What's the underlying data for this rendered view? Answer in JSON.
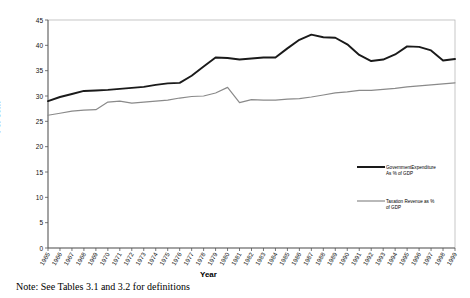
{
  "note": "Note: See Tables 3.1 and 3.2 for definitions",
  "axis": {
    "ylabel": "Per cent",
    "xlabel": "Year"
  },
  "legend": {
    "gov_label": "GovernmentExpenditure\nAs % of GDP",
    "tax_label": "Taxation Revenue as %\nof GDP",
    "gov_color": "#1a1a1a",
    "tax_color": "#8a8a8a"
  },
  "chart_data": {
    "type": "line",
    "title": "",
    "xlabel": "Year",
    "ylabel": "Per cent",
    "ylim": [
      0,
      45
    ],
    "yticks": [
      0,
      5,
      10,
      15,
      20,
      25,
      30,
      35,
      40,
      45
    ],
    "grid": false,
    "legend_position": "right",
    "categories": [
      "1965",
      "1966",
      "1967",
      "1968",
      "1969",
      "1970",
      "1971",
      "1972",
      "1973",
      "1974",
      "1975",
      "1976",
      "1977",
      "1978",
      "1979",
      "1980",
      "1981",
      "1982",
      "1983",
      "1984",
      "1985",
      "1986",
      "1987",
      "1988",
      "1989",
      "1990",
      "1991",
      "1992",
      "1993",
      "1994",
      "1995",
      "1996",
      "1997",
      "1998",
      "1999"
    ],
    "series": [
      {
        "name": "GovernmentExpenditure As % of GDP",
        "color": "#1a1a1a",
        "values": [
          29.0,
          29.8,
          30.4,
          31.0,
          31.1,
          31.2,
          31.4,
          31.6,
          31.8,
          32.2,
          32.5,
          32.6,
          34.0,
          35.8,
          37.6,
          37.5,
          37.2,
          37.4,
          37.6,
          37.6,
          39.4,
          41.1,
          42.1,
          41.6,
          41.5,
          40.2,
          38.1,
          36.9,
          37.2,
          38.2,
          39.8,
          39.7,
          39.0,
          37.0,
          37.3
        ]
      },
      {
        "name": "Taxation Revenue as % of GDP",
        "color": "#8a8a8a",
        "values": [
          26.2,
          26.6,
          27.0,
          27.2,
          27.3,
          28.8,
          29.0,
          28.6,
          28.8,
          29.0,
          29.2,
          29.6,
          29.9,
          30.0,
          30.6,
          31.7,
          28.7,
          29.3,
          29.2,
          29.2,
          29.4,
          29.5,
          29.8,
          30.2,
          30.6,
          30.8,
          31.1,
          31.1,
          31.3,
          31.5,
          31.8,
          32.0,
          32.2,
          32.4,
          32.6
        ]
      }
    ]
  }
}
